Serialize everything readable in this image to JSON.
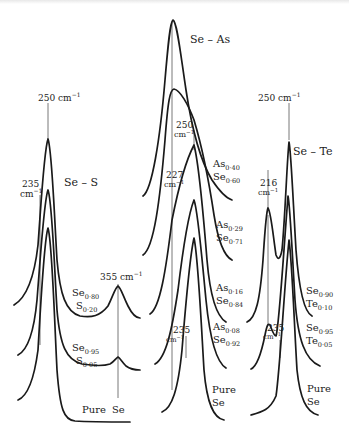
{
  "figure": {
    "type": "raman-spectra-stack",
    "panels": [
      {
        "name": "Se-S",
        "title": "Se – S",
        "peak_labels": [
          {
            "value": "250 cm⁻¹",
            "line1": "250 cm",
            "sup": "−1"
          },
          {
            "value": "235 cm⁻¹",
            "line1": "235",
            "line2": "cm",
            "sup": "−1"
          },
          {
            "value": "355 cm⁻¹",
            "line1": "355 cm",
            "sup": "−1"
          }
        ],
        "curves": [
          {
            "label_a": "Se",
            "sub_a": "0·80",
            "label_b": "S",
            "sub_b": "0·20"
          },
          {
            "label_a": "Se",
            "sub_a": "0·95",
            "label_b": "S",
            "sub_b": "0·05"
          },
          {
            "label_a": "Pure",
            "label_b": "Se"
          }
        ]
      },
      {
        "name": "Se-As",
        "title": "Se – As",
        "peak_labels": [
          {
            "value": "250 cm⁻¹",
            "line1": "250",
            "line2": "cm",
            "sup": "−1"
          },
          {
            "value": "227 cm⁻¹",
            "line1": "227",
            "line2": "cm",
            "sup": "−1"
          },
          {
            "value": "235 cm⁻¹",
            "line1": "235",
            "line2": "cm",
            "sup": "−1"
          }
        ],
        "curves": [
          {
            "label_a": "As",
            "sub_a": "0·40",
            "label_b": "Se",
            "sub_b": "0·60"
          },
          {
            "label_a": "As",
            "sub_a": "0·29",
            "label_b": "Se",
            "sub_b": "0·71"
          },
          {
            "label_a": "As",
            "sub_a": "0·16",
            "label_b": "Se",
            "sub_b": "0·84"
          },
          {
            "label_a": "As",
            "sub_a": "0·08",
            "label_b": "Se",
            "sub_b": "0·92"
          },
          {
            "label_a": "Pure",
            "label_b": "Se"
          }
        ]
      },
      {
        "name": "Se-Te",
        "title": "Se – Te",
        "peak_labels": [
          {
            "value": "250 cm⁻¹",
            "line1": "250 cm",
            "sup": "−1"
          },
          {
            "value": "216 cm⁻¹",
            "line1": "216",
            "line2": "cm",
            "sup": "−1"
          },
          {
            "value": "235 cm⁻¹",
            "line1": "235",
            "line2": "cm",
            "sup": "−1"
          }
        ],
        "curves": [
          {
            "label_a": "Se",
            "sub_a": "0·90",
            "label_b": "Te",
            "sub_b": "0·10"
          },
          {
            "label_a": "Se",
            "sub_a": "0·95",
            "label_b": "Te",
            "sub_b": "0·05"
          },
          {
            "label_a": "Pure",
            "label_b": "Se"
          }
        ]
      }
    ]
  }
}
